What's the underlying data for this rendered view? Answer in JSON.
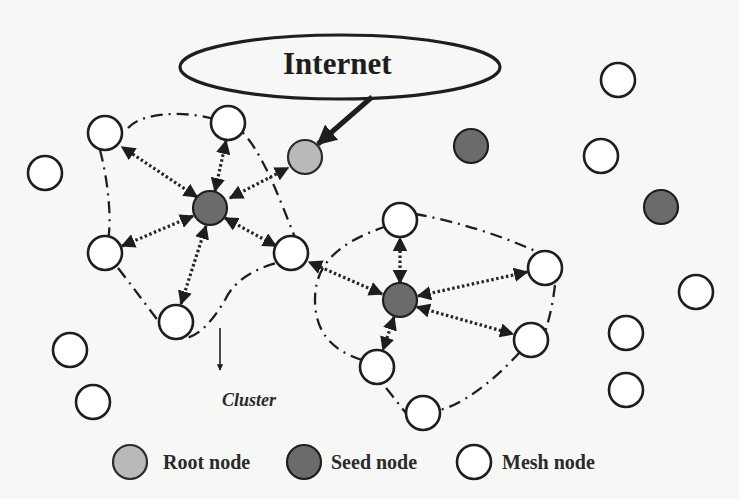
{
  "diagram": {
    "internet": {
      "label": "Internet",
      "cx": 340,
      "cy": 67,
      "rx": 160,
      "ry": 32
    },
    "cluster_label": "Cluster",
    "colors": {
      "mesh": "#ffffff",
      "seed": "#6b6b6b",
      "root": "#b9b9b9",
      "stroke": "#1e1e1e"
    },
    "root_node": {
      "x": 305,
      "y": 157
    },
    "clusters": [
      {
        "seed": {
          "x": 210,
          "y": 208
        },
        "mesh": [
          {
            "x": 105,
            "y": 133
          },
          {
            "x": 228,
            "y": 123
          },
          {
            "x": 105,
            "y": 253
          },
          {
            "x": 176,
            "y": 322
          },
          {
            "x": 291,
            "y": 253
          }
        ]
      },
      {
        "seed": {
          "x": 400,
          "y": 300
        },
        "mesh": [
          {
            "x": 400,
            "y": 220
          },
          {
            "x": 545,
            "y": 268
          },
          {
            "x": 531,
            "y": 340
          },
          {
            "x": 377,
            "y": 367
          },
          {
            "x": 423,
            "y": 413
          }
        ]
      }
    ],
    "isolated_nodes": [
      {
        "type": "mesh",
        "x": 45,
        "y": 173
      },
      {
        "type": "mesh",
        "x": 70,
        "y": 350
      },
      {
        "type": "mesh",
        "x": 93,
        "y": 402
      },
      {
        "type": "seed",
        "x": 471,
        "y": 146
      },
      {
        "type": "mesh",
        "x": 618,
        "y": 80
      },
      {
        "type": "mesh",
        "x": 601,
        "y": 156
      },
      {
        "type": "seed",
        "x": 661,
        "y": 207
      },
      {
        "type": "mesh",
        "x": 696,
        "y": 292
      },
      {
        "type": "mesh",
        "x": 626,
        "y": 333
      },
      {
        "type": "mesh",
        "x": 626,
        "y": 390
      }
    ]
  },
  "legend": {
    "items": [
      {
        "type": "root",
        "label": "Root node"
      },
      {
        "type": "seed",
        "label": "Seed node"
      },
      {
        "type": "mesh",
        "label": "Mesh node"
      }
    ]
  }
}
